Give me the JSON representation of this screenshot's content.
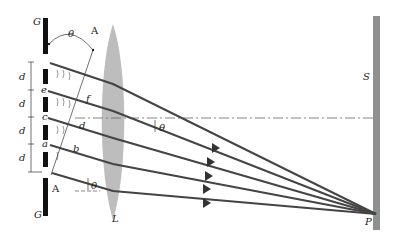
{
  "diagram": {
    "labels": {
      "grating_top": "G",
      "grating_bottom": "G",
      "angle_top": "θ",
      "point_A_top": "A",
      "point_A_bottom": "A",
      "slit_e": "e",
      "slit_c": "c",
      "slit_a": "a",
      "ray_label_f": "f",
      "ray_label_d": "d",
      "ray_label_b": "b",
      "angle_mid": "θ",
      "angle_bottom": "θ",
      "lens": "L",
      "screen": "S",
      "focus_point": "P",
      "spacing": [
        "d",
        "d",
        "d",
        "d"
      ]
    },
    "colors": {
      "grating": "#111111",
      "rays": "#444444",
      "lens": "#bdbdbd",
      "screen": "#8f8f8f",
      "axis": "#555555"
    },
    "ray_count": 5
  }
}
